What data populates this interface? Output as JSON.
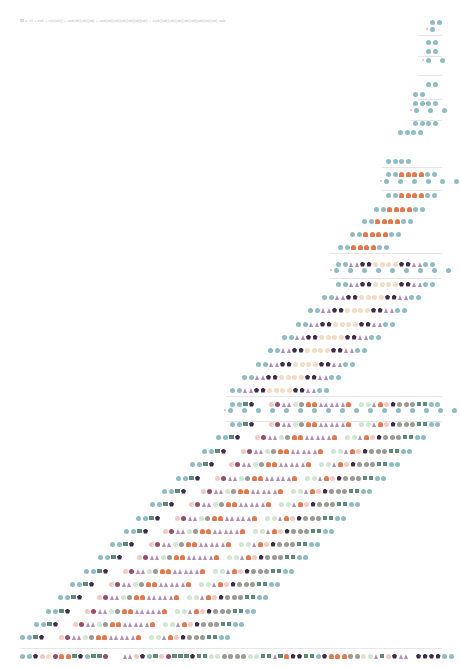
{
  "caption": {
    "number": "11",
    "text": "≥ ×0 + ≥ab + ≥(≥(ab)) + ≥ab(ab)(ab)(ab) + ≥ab(ab)(ab)(ab)(ab)(ab)(ab) + ≥(ab)(ab)(ab)(ab)(ab)(ab)(ab)(ab)(ab) ≥ab"
  },
  "palette": {
    "c": "#8fbcc4",
    "o": "#e07b4f",
    "t": "#b48fb4",
    "p": "#3d2b4a",
    "b": "#f3dcc4",
    "g": "#9a9a94",
    "s": "#5f8a78",
    "m": "#9b4a6a",
    "l": "#cfe6d0",
    "n": "#f2c9c0",
    "x": "#e9b9a8"
  },
  "legend_shapes": {
    "c": "teal-circle",
    "o": "orange-dome",
    "t": "mauve-triangle",
    "p": "dark-pentagon",
    "b": "beige-circle",
    "g": "grey-circle",
    "s": "green-square",
    "m": "maroon-circle",
    "l": "light-green-circle",
    "n": "pink-circle"
  },
  "separators": [
    {
      "y": 35,
      "x1": 418,
      "x2": 442
    },
    {
      "y": 56,
      "x1": 418,
      "x2": 442
    },
    {
      "y": 75,
      "x1": 418,
      "x2": 442
    },
    {
      "y": 99,
      "x1": 418,
      "x2": 442
    },
    {
      "y": 120,
      "x1": 410,
      "x2": 442
    },
    {
      "y": 167,
      "x1": 382,
      "x2": 442
    },
    {
      "y": 190,
      "x1": 382,
      "x2": 442
    },
    {
      "y": 253,
      "x1": 330,
      "x2": 442
    },
    {
      "y": 278,
      "x1": 330,
      "x2": 442
    },
    {
      "y": 396,
      "x1": 226,
      "x2": 442
    },
    {
      "y": 421,
      "x1": 226,
      "x2": 442
    },
    {
      "y": 648,
      "x1": 20,
      "x2": 442
    }
  ],
  "rows": [
    {
      "x": 430,
      "y": 22,
      "seq": "cc"
    },
    {
      "x": 426,
      "y": 29,
      "seq": "xc",
      "sparse": true
    },
    {
      "x": 426,
      "y": 42,
      "seq": "cc"
    },
    {
      "x": 426,
      "y": 51,
      "seq": "cc"
    },
    {
      "x": 422,
      "y": 60,
      "seq": "xc_c",
      "sparse": true
    },
    {
      "x": 426,
      "y": 84,
      "seq": "cc"
    },
    {
      "x": 413,
      "y": 94,
      "seq": "cc"
    },
    {
      "x": 413,
      "y": 103,
      "seq": "cccc"
    },
    {
      "x": 410,
      "y": 110,
      "seq": "xc_c_c",
      "sparse": true
    },
    {
      "x": 413,
      "y": 123,
      "seq": "cccc"
    },
    {
      "x": 398,
      "y": 132,
      "seq": "cccc"
    },
    {
      "x": 386,
      "y": 161,
      "seq": "cccc"
    },
    {
      "x": 386,
      "y": 174,
      "seq": "ccoooocc"
    },
    {
      "x": 380,
      "y": 181,
      "seq": "xc_c_c_c_c_c",
      "sparse": true
    },
    {
      "x": 386,
      "y": 195,
      "seq": "ccoooocc"
    },
    {
      "x": 374,
      "y": 209,
      "seq": "ccoooocc"
    },
    {
      "x": 362,
      "y": 221,
      "seq": "ccoooocc"
    },
    {
      "x": 350,
      "y": 234,
      "seq": "ccoooocc"
    },
    {
      "x": 338,
      "y": 247,
      "seq": "ccoooocc"
    },
    {
      "x": 336,
      "y": 264,
      "seq": "ccttppbbbbppttcc"
    },
    {
      "x": 330,
      "y": 270,
      "seq": "xc_c_c_c_c_c_c_c_c",
      "sparse": true
    },
    {
      "x": 336,
      "y": 284,
      "seq": "ccttppbbbbppttcc"
    },
    {
      "x": 322,
      "y": 297,
      "seq": "ccttppbbbbppttcc"
    },
    {
      "x": 308,
      "y": 310,
      "seq": "ccttppbbbbppttcc"
    },
    {
      "x": 296,
      "y": 324,
      "seq": "ccttppbbbbppttcc"
    },
    {
      "x": 282,
      "y": 337,
      "seq": "ccttppbbbbppttcc"
    },
    {
      "x": 268,
      "y": 350,
      "seq": "ccttppbbbbppttcc"
    },
    {
      "x": 256,
      "y": 364,
      "seq": "ccttppbbbbppttcc"
    },
    {
      "x": 242,
      "y": 377,
      "seq": "ccttppbbbbppttcc"
    },
    {
      "x": 230,
      "y": 390,
      "seq": "ccttppbbbbppttcc"
    },
    {
      "x": 230,
      "y": 404,
      "seq": "ccsp__nmttlgoottttto_lltonpgggsscc"
    },
    {
      "x": 224,
      "y": 410,
      "seq": "xc_c_c_c_c_c_c_c_c_c_c_c_c_c_c_c_c",
      "sparse": true
    },
    {
      "x": 230,
      "y": 424,
      "seq": "ccsp__nmttlgoottttto_lltonpgggsscc"
    },
    {
      "x": 216,
      "y": 437,
      "seq": "ccsp__nmttlgoottttto_lltonpgggsscc"
    },
    {
      "x": 202,
      "y": 451,
      "seq": "ccsp__nmttlgoottttto_lltonpgggsscc"
    },
    {
      "x": 190,
      "y": 464,
      "seq": "ccsp__nmttlgoottttto_lltonpgggsscc"
    },
    {
      "x": 176,
      "y": 478,
      "seq": "ccsp__nmttlgoottttto_lltonpgggsscc"
    },
    {
      "x": 162,
      "y": 491,
      "seq": "ccsp__nmttlgoottttto_lltonpgggsscc"
    },
    {
      "x": 150,
      "y": 504,
      "seq": "ccsp__nmttlgoottttto_lltonpgggsscc"
    },
    {
      "x": 136,
      "y": 518,
      "seq": "ccsp__nmttlgoottttto_lltonpgggsscc"
    },
    {
      "x": 124,
      "y": 531,
      "seq": "ccsp__nmttlgoottttto_lltonpgggsscc"
    },
    {
      "x": 110,
      "y": 544,
      "seq": "ccsp__nmttlgoottttto_lltonpgggsscc"
    },
    {
      "x": 98,
      "y": 557,
      "seq": "ccsp__nmttlgoottttto_lltonpgggsscc"
    },
    {
      "x": 84,
      "y": 571,
      "seq": "ccsp__nmttlgoottttto_lltonpgggsscc"
    },
    {
      "x": 70,
      "y": 584,
      "seq": "ccsp__nmttlgoottttto_lltonpgggsscc"
    },
    {
      "x": 58,
      "y": 597,
      "seq": "ccsp__nmttlgoottttto_lltonpgggsscc"
    },
    {
      "x": 46,
      "y": 611,
      "seq": "ccsp__nmttlgoottttto_lltonpgggsscc"
    },
    {
      "x": 34,
      "y": 624,
      "seq": "ccsp__nmttlgoottttto_lltonpgggsscc"
    },
    {
      "x": 20,
      "y": 637,
      "seq": "ccsp__nmttlgoottttto_lltonpgggsscc"
    },
    {
      "x": 20,
      "y": 656,
      "seq": "ccpnbmoospcssm__ttnpcsnmssspssllggggllsstsoppsscpoooggbltsnptt_ppppcc"
    }
  ]
}
